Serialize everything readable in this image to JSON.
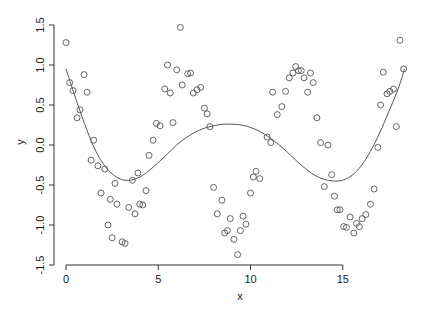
{
  "chart_data": {
    "type": "scatter",
    "title": "",
    "xlabel": "x",
    "ylabel": "y",
    "xlim": [
      -0.5,
      18.9
    ],
    "ylim": [
      -1.55,
      1.55
    ],
    "x_ticks": [
      0,
      5,
      10,
      15
    ],
    "x_tick_labels": [
      "0",
      "5",
      "10",
      "15"
    ],
    "y_ticks": [
      -1.5,
      -1.0,
      -0.5,
      0.0,
      0.5,
      1.0,
      1.5
    ],
    "y_tick_labels": [
      "-1.5",
      "-1.0",
      "-0.5",
      "0.0",
      "0.5",
      "1.0",
      "1.5"
    ],
    "grid": false,
    "legend": null,
    "series": [
      {
        "name": "observations",
        "kind": "points",
        "marker": "open-circle",
        "color": "#555555",
        "points": [
          [
            0.0,
            1.28
          ],
          [
            0.2,
            0.78
          ],
          [
            0.38,
            0.68
          ],
          [
            0.6,
            0.34
          ],
          [
            0.76,
            0.44
          ],
          [
            0.98,
            0.88
          ],
          [
            1.14,
            0.66
          ],
          [
            1.36,
            -0.19
          ],
          [
            1.5,
            0.06
          ],
          [
            1.73,
            -0.26
          ],
          [
            1.9,
            -0.6
          ],
          [
            2.1,
            -0.3
          ],
          [
            2.28,
            -1.0
          ],
          [
            2.4,
            -0.68
          ],
          [
            2.5,
            -1.16
          ],
          [
            2.66,
            -0.48
          ],
          [
            2.76,
            -0.74
          ],
          [
            3.04,
            -1.21
          ],
          [
            3.2,
            -1.23
          ],
          [
            3.4,
            -0.78
          ],
          [
            3.6,
            -0.44
          ],
          [
            3.74,
            -0.86
          ],
          [
            3.9,
            -0.35
          ],
          [
            4.0,
            -0.74
          ],
          [
            4.16,
            -0.75
          ],
          [
            4.34,
            -0.57
          ],
          [
            4.5,
            -0.13
          ],
          [
            4.72,
            0.06
          ],
          [
            4.9,
            0.27
          ],
          [
            5.1,
            0.24
          ],
          [
            5.35,
            0.7
          ],
          [
            5.5,
            1.0
          ],
          [
            5.65,
            0.65
          ],
          [
            5.8,
            0.28
          ],
          [
            6.0,
            0.94
          ],
          [
            6.2,
            1.47
          ],
          [
            6.3,
            0.75
          ],
          [
            6.6,
            0.89
          ],
          [
            6.75,
            0.9
          ],
          [
            6.9,
            0.65
          ],
          [
            7.1,
            0.69
          ],
          [
            7.3,
            0.72
          ],
          [
            7.5,
            0.46
          ],
          [
            7.65,
            0.39
          ],
          [
            7.8,
            0.23
          ],
          [
            8.0,
            -0.53
          ],
          [
            8.2,
            -0.86
          ],
          [
            8.45,
            -0.69
          ],
          [
            8.6,
            -1.1
          ],
          [
            8.75,
            -1.07
          ],
          [
            8.9,
            -0.92
          ],
          [
            9.1,
            -1.18
          ],
          [
            9.3,
            -1.37
          ],
          [
            9.45,
            -1.07
          ],
          [
            9.6,
            -0.89
          ],
          [
            9.75,
            -0.99
          ],
          [
            10.0,
            -0.6
          ],
          [
            10.15,
            -0.4
          ],
          [
            10.3,
            -0.33
          ],
          [
            10.5,
            -0.42
          ],
          [
            10.9,
            0.1
          ],
          [
            11.1,
            0.03
          ],
          [
            11.2,
            0.66
          ],
          [
            11.45,
            0.38
          ],
          [
            11.7,
            0.48
          ],
          [
            11.9,
            0.67
          ],
          [
            12.1,
            0.84
          ],
          [
            12.3,
            0.9
          ],
          [
            12.45,
            0.98
          ],
          [
            12.6,
            0.93
          ],
          [
            12.75,
            0.93
          ],
          [
            12.9,
            0.84
          ],
          [
            13.1,
            0.66
          ],
          [
            13.25,
            0.9
          ],
          [
            13.4,
            0.78
          ],
          [
            13.6,
            0.34
          ],
          [
            13.8,
            0.03
          ],
          [
            14.0,
            -0.52
          ],
          [
            14.2,
            0.0
          ],
          [
            14.4,
            -0.37
          ],
          [
            14.55,
            -0.64
          ],
          [
            14.7,
            -0.81
          ],
          [
            14.85,
            -0.81
          ],
          [
            15.05,
            -1.02
          ],
          [
            15.2,
            -1.03
          ],
          [
            15.4,
            -0.9
          ],
          [
            15.6,
            -1.1
          ],
          [
            15.75,
            -0.98
          ],
          [
            15.9,
            -1.02
          ],
          [
            16.05,
            -0.92
          ],
          [
            16.25,
            -0.87
          ],
          [
            16.5,
            -0.74
          ],
          [
            16.7,
            -0.55
          ],
          [
            16.9,
            -0.03
          ],
          [
            17.05,
            0.5
          ],
          [
            17.2,
            0.91
          ],
          [
            17.4,
            0.64
          ],
          [
            17.55,
            0.67
          ],
          [
            17.75,
            0.7
          ],
          [
            17.9,
            0.23
          ],
          [
            18.1,
            1.31
          ],
          [
            18.3,
            0.95
          ]
        ]
      },
      {
        "name": "smooth fit",
        "kind": "line",
        "color": "#555555",
        "points": [
          [
            0.0,
            0.95
          ],
          [
            0.5,
            0.6
          ],
          [
            1.0,
            0.27
          ],
          [
            1.5,
            -0.02
          ],
          [
            2.0,
            -0.23
          ],
          [
            2.5,
            -0.36
          ],
          [
            3.0,
            -0.43
          ],
          [
            3.5,
            -0.44
          ],
          [
            4.0,
            -0.4
          ],
          [
            4.5,
            -0.32
          ],
          [
            5.0,
            -0.22
          ],
          [
            5.5,
            -0.11
          ],
          [
            6.0,
            0.0
          ],
          [
            6.5,
            0.09
          ],
          [
            7.0,
            0.16
          ],
          [
            7.5,
            0.21
          ],
          [
            8.0,
            0.24
          ],
          [
            8.5,
            0.26
          ],
          [
            9.0,
            0.26
          ],
          [
            9.5,
            0.25
          ],
          [
            10.0,
            0.22
          ],
          [
            10.5,
            0.17
          ],
          [
            11.0,
            0.1
          ],
          [
            11.5,
            0.01
          ],
          [
            12.0,
            -0.09
          ],
          [
            12.5,
            -0.2
          ],
          [
            13.0,
            -0.3
          ],
          [
            13.5,
            -0.38
          ],
          [
            14.0,
            -0.43
          ],
          [
            14.5,
            -0.45
          ],
          [
            15.0,
            -0.44
          ],
          [
            15.5,
            -0.38
          ],
          [
            16.0,
            -0.26
          ],
          [
            16.5,
            -0.08
          ],
          [
            17.0,
            0.15
          ],
          [
            17.5,
            0.42
          ],
          [
            18.0,
            0.7
          ],
          [
            18.35,
            0.95
          ]
        ]
      }
    ]
  },
  "layout": {
    "plot_px": {
      "x0": 66,
      "x_per_unit": 18.45,
      "y0": 145,
      "y_per_unit": 80
    },
    "frame": {
      "left": 54,
      "top": 18,
      "right": 434,
      "bottom": 262
    }
  }
}
